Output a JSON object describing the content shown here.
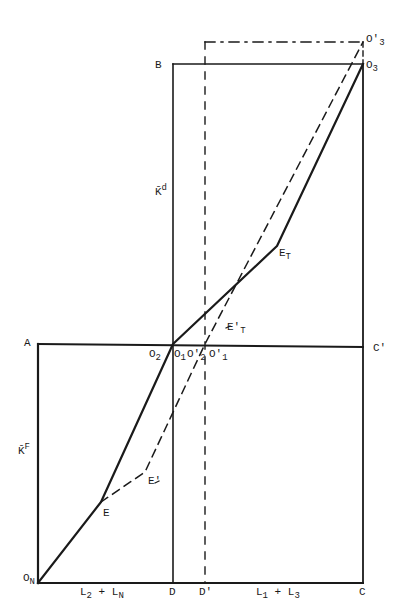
{
  "diagram": {
    "type": "economic box diagram (Edgeworth-style factor allocation)",
    "stroke_color": "#1a1a1a",
    "points": {
      "O_N": [
        38,
        583
      ],
      "A": [
        38,
        344
      ],
      "D": [
        173,
        583
      ],
      "D_prime": [
        205,
        583
      ],
      "C": [
        363,
        583
      ],
      "C_prime": [
        363,
        347
      ],
      "B": [
        173,
        64
      ],
      "O_3": [
        363,
        64
      ],
      "O_3_prime": [
        363,
        42
      ],
      "E": [
        101,
        502
      ],
      "E_prime": [
        145,
        472
      ],
      "O_2": [
        173,
        344
      ],
      "O_1_prime": [
        205,
        344
      ],
      "E_T": [
        277,
        246
      ]
    },
    "solid_path": [
      "O_N",
      "E",
      "O_2",
      "E_T",
      "O_3"
    ],
    "dashed_path": [
      "E",
      "E_prime",
      "O_1_prime",
      "O_3_prime"
    ],
    "labels": {
      "O_N": {
        "main": "O",
        "sub": "N"
      },
      "A": "A",
      "B": "B",
      "C": "C",
      "C_prime": "C′",
      "D": "D",
      "D_prime": "D′",
      "E": "E",
      "E_prime": "E′",
      "E_T": {
        "main": "E",
        "sub": "T"
      },
      "E_T_prime": {
        "main": "E′",
        "sub": "T"
      },
      "O_1": {
        "main": "O",
        "sub": "1"
      },
      "O_2": {
        "main": "O",
        "sub": "2"
      },
      "O_2_prime": {
        "main": "O′",
        "sub": "2"
      },
      "O_1_prime": {
        "main": "O′",
        "sub": "1"
      },
      "O_3": {
        "main": "O",
        "sub": "3"
      },
      "O_3_prime": {
        "main": "O′",
        "sub": "3"
      },
      "K_F": {
        "main": "K̄",
        "sup": "F"
      },
      "K_d": {
        "main": "K̄",
        "sup": "d"
      },
      "bottom_left_axis": {
        "a": "L",
        "a_sub": "2",
        "op": " + ",
        "b": "L",
        "b_sub": "N"
      },
      "bottom_right_axis": {
        "a": "L",
        "a_sub": "1",
        "op": " + ",
        "b": "L",
        "b_sub": "3"
      }
    }
  }
}
